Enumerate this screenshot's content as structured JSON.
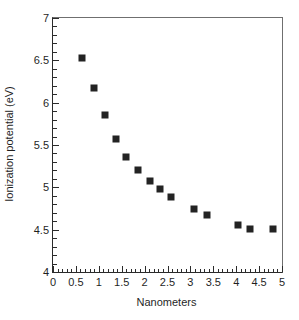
{
  "chart_data": {
    "type": "scatter",
    "title": "",
    "xlabel": "Nanometers",
    "ylabel": "Ionization potential (eV)",
    "xlim": [
      0,
      5
    ],
    "ylim": [
      4,
      7
    ],
    "x_major_ticks": [
      0,
      0.5,
      1,
      1.5,
      2,
      2.5,
      3,
      3.5,
      4,
      4.5,
      5
    ],
    "y_major_ticks": [
      4,
      4.5,
      5,
      5.5,
      6,
      6.5,
      7
    ],
    "x_tick_labels": [
      "0",
      "0.5",
      "1",
      "1.5",
      "2",
      "2.5",
      "3",
      "3.5",
      "4",
      "4.5",
      "5"
    ],
    "y_tick_labels": [
      "4",
      "4.5",
      "5",
      "5.5",
      "6",
      "6.5",
      "7"
    ],
    "x_minor_tick_step": 0.1,
    "y_minor_tick_step": 0.1,
    "grid": false,
    "legend": false,
    "marker": "filled-square",
    "marker_color": "#232323",
    "series": [
      {
        "name": "Ionization potential",
        "points": [
          {
            "x": 0.63,
            "y": 6.53
          },
          {
            "x": 0.89,
            "y": 6.17
          },
          {
            "x": 1.13,
            "y": 5.86
          },
          {
            "x": 1.38,
            "y": 5.57
          },
          {
            "x": 1.59,
            "y": 5.36
          },
          {
            "x": 1.85,
            "y": 5.21
          },
          {
            "x": 2.11,
            "y": 5.08
          },
          {
            "x": 2.34,
            "y": 4.98
          },
          {
            "x": 2.57,
            "y": 4.88
          },
          {
            "x": 3.07,
            "y": 4.74
          },
          {
            "x": 3.37,
            "y": 4.67
          },
          {
            "x": 4.05,
            "y": 4.55
          },
          {
            "x": 4.3,
            "y": 4.51
          },
          {
            "x": 4.8,
            "y": 4.51
          }
        ]
      }
    ]
  },
  "axes": {
    "x_title": "Nanometers",
    "y_title": "Ionization potential (eV)"
  },
  "caption": {
    "sliver_text": ""
  }
}
